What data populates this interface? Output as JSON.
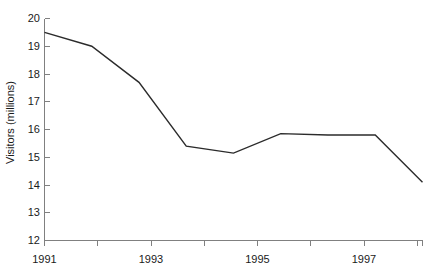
{
  "chart_data": {
    "type": "line",
    "title": "",
    "subtitle": "",
    "xlabel": "",
    "ylabel": "Visitors (millions)",
    "x": [
      1991,
      1992,
      1993,
      1994,
      1995,
      1996,
      1997,
      1998,
      1999
    ],
    "categories": [
      "1991",
      "1992",
      "1993",
      "1994",
      "1995",
      "1996",
      "1997",
      "1998",
      "1999"
    ],
    "values": [
      19.5,
      19.0,
      17.7,
      15.4,
      15.15,
      15.85,
      15.8,
      15.8,
      14.1
    ],
    "series": [
      {
        "name": "Visitors",
        "values": [
          19.5,
          19.0,
          17.7,
          15.4,
          15.15,
          15.85,
          15.8,
          15.8,
          14.1
        ]
      }
    ],
    "xlim": [
      1991,
      1999
    ],
    "ylim": [
      12,
      20
    ],
    "ytick_values": [
      12,
      13,
      14,
      15,
      16,
      17,
      18,
      19,
      20
    ],
    "ytick_labels": [
      "12",
      "13",
      "14",
      "15",
      "16",
      "17",
      "18",
      "19",
      "20"
    ],
    "xtick_values": [
      1991,
      1992,
      1993,
      1994,
      1995,
      1996,
      1997,
      1998,
      1999
    ],
    "xtick_labels": [
      "1991",
      "",
      "1993",
      "",
      "1995",
      "",
      "1997",
      "",
      ""
    ],
    "xtick_labels_shown": [
      "1991",
      "1993",
      "1995",
      "1997"
    ],
    "grid": false,
    "legend": false,
    "legend_position": "none",
    "annotations": [],
    "line_color": "#2b2b2b",
    "axis_color": "#808080",
    "background_color": "#ffffff"
  },
  "axis": {
    "y_label": "Visitors (millions)",
    "y_ticks": [
      {
        "value": 20,
        "label": "20"
      },
      {
        "value": 19,
        "label": "19"
      },
      {
        "value": 18,
        "label": "18"
      },
      {
        "value": 17,
        "label": "17"
      },
      {
        "value": 16,
        "label": "16"
      },
      {
        "value": 15,
        "label": "15"
      },
      {
        "value": 14,
        "label": "14"
      },
      {
        "value": 13,
        "label": "13"
      },
      {
        "value": 12,
        "label": "12"
      }
    ],
    "x_ticks": [
      {
        "value": 1991,
        "label": "1991"
      },
      {
        "value": 1992,
        "label": ""
      },
      {
        "value": 1993,
        "label": "1993"
      },
      {
        "value": 1994,
        "label": ""
      },
      {
        "value": 1995,
        "label": "1995"
      },
      {
        "value": 1996,
        "label": ""
      },
      {
        "value": 1997,
        "label": "1997"
      },
      {
        "value": 1998,
        "label": ""
      },
      {
        "value": 1999,
        "label": ""
      }
    ]
  }
}
